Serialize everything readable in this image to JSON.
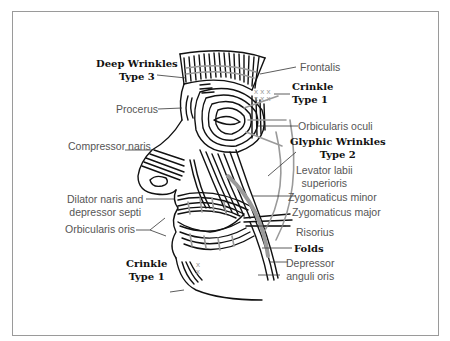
{
  "figure": {
    "type": "facial-muscle-anatomy-diagram",
    "colors": {
      "line": "#111111",
      "muscle_accent": "#9a9a9a",
      "frame": "#9a9a9a",
      "label_regular": "#555555",
      "label_bold": "#111111"
    }
  },
  "labels_left": {
    "deep_wrinkles": {
      "line1": "Deep Wrinkles",
      "line2": "Type 3"
    },
    "procerus": "Procerus",
    "compressor_naris": "Compressor naris",
    "dilator_naris": {
      "line1": "Dilator naris and",
      "line2": "depressor septi"
    },
    "orbicularis_oris": "Orbicularis oris",
    "crinkle_lower": {
      "line1": "Crinkle",
      "line2": "Type 1"
    }
  },
  "labels_right": {
    "frontalis": "Frontalis",
    "crinkle_upper": {
      "line1": "Crinkle",
      "line2": "Type 1"
    },
    "orbicularis_oculi": "Orbicularis oculi",
    "glyphic_wrinkles": {
      "line1": "Glyphic Wrinkles",
      "line2": "Type 2"
    },
    "levator_labii": {
      "line1": "Levator labii",
      "line2": "superioris"
    },
    "zygomaticus_minor": "Zygomaticus minor",
    "zygomaticus_major": "Zygomaticus major",
    "risorius": "Risorius",
    "folds": "Folds",
    "depressor_anguli": {
      "line1": "Depressor",
      "line2": "anguli oris"
    }
  },
  "markers": {
    "crinkle_upper_marks": "x x x",
    "crinkle_lower_marks": "x"
  }
}
